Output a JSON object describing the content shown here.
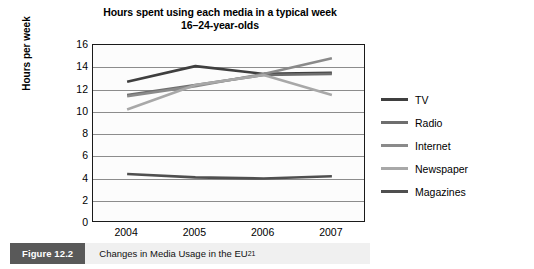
{
  "chart_data": {
    "type": "line",
    "title": "Hours spent using each media in a typical week",
    "subtitle": "16–24-year-olds",
    "xlabel": "",
    "ylabel": "Hours per week",
    "categories": [
      "2004",
      "2005",
      "2006",
      "2007"
    ],
    "x": [
      2004,
      2005,
      2006,
      2007
    ],
    "ylim": [
      0,
      16
    ],
    "ytick_step": 2,
    "yticks": [
      "16",
      "14",
      "12",
      "10",
      "8",
      "6",
      "4",
      "2",
      "0"
    ],
    "grid": true,
    "legend_position": "right",
    "series": [
      {
        "name": "TV",
        "values": [
          12.7,
          14.1,
          13.4,
          13.5
        ],
        "color": "#3f3f3f"
      },
      {
        "name": "Radio",
        "values": [
          11.5,
          12.4,
          13.3,
          13.4
        ],
        "color": "#6e6e6e"
      },
      {
        "name": "Internet",
        "values": [
          11.4,
          12.3,
          13.4,
          14.8
        ],
        "color": "#8a8a8a"
      },
      {
        "name": "Newspaper",
        "values": [
          10.2,
          12.4,
          13.3,
          11.5
        ],
        "color": "#a8a8a8"
      },
      {
        "name": "Magazines",
        "values": [
          4.4,
          4.1,
          4.0,
          4.2
        ],
        "color": "#4f4f4f"
      }
    ]
  },
  "caption": {
    "number": "Figure 12.2",
    "text": "Changes in Media Usage in the EU",
    "superscript": "21"
  }
}
